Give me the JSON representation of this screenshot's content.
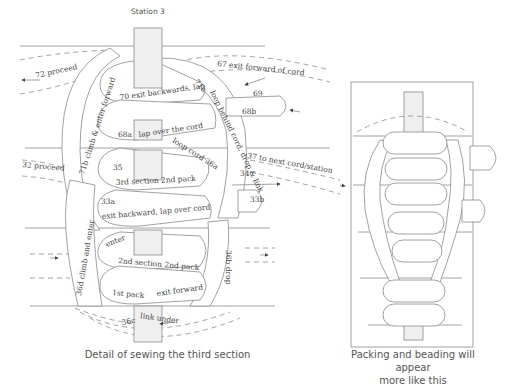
{
  "left_diagram": {
    "station_label": "Station 3",
    "caption": "Detail of sewing the third section",
    "labels": {
      "l72": "72  proceed",
      "l67": "67  exit forward of cord",
      "l71a": "71a",
      "l_loop_behind": "loop behind cord, drop & link",
      "l69": "69",
      "l68b": "68b",
      "l70": "70 exit backwards, lap",
      "l68a": "68a",
      "l_lap_over": "lap over the cord",
      "l71b": "71b  climb & enter forward",
      "l_loop_cord": "loop cord 36a",
      "l37": "37 to next cord/station",
      "l32": "32 proceed",
      "l35": "35",
      "l3rd": "3rd section 2nd pack",
      "l34": "34",
      "l33b": "33b",
      "l33a": "33a",
      "l_exit_backward": "exit backward, lap over cord",
      "l36d": "36d  climb and enter",
      "l36b": "36b   drop",
      "l_enter": "enter",
      "l2nd": "2nd section 2nd pack",
      "l1st": "1st pack",
      "l_exit_forward": "exit forward",
      "l36c": "36c",
      "l_link_under": "link under"
    }
  },
  "right_diagram": {
    "caption_line1": "Packing and beading will appear",
    "caption_line2": "more like this"
  }
}
